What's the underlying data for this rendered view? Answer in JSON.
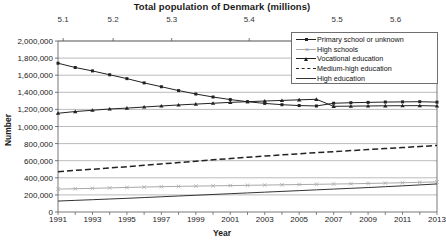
{
  "chart_data": {
    "type": "line",
    "title": "Total population of Denmark (millions)",
    "xlabel": "Year",
    "ylabel": "Number",
    "ylim": [
      0,
      2000000
    ],
    "grid": true,
    "legend_position": "top-right",
    "y_ticks": [
      "0",
      "200,000",
      "400,000",
      "600,000",
      "800,000",
      "1,000,000",
      "1,200,000",
      "1,400,000",
      "1,600,000",
      "1,800,000",
      "2,000,000"
    ],
    "y_tick_values": [
      0,
      200000,
      400000,
      600000,
      800000,
      1000000,
      1200000,
      1400000,
      1600000,
      1800000,
      2000000
    ],
    "x": [
      1991,
      1992,
      1993,
      1994,
      1995,
      1996,
      1997,
      1998,
      1999,
      2000,
      2001,
      2002,
      2003,
      2004,
      2005,
      2006,
      2007,
      2008,
      2009,
      2010,
      2011,
      2012,
      2013
    ],
    "x_tick_labels": [
      "1991",
      "1993",
      "1995",
      "1997",
      "1999",
      "2001",
      "2003",
      "2005",
      "2007",
      "2009",
      "2011",
      "2013"
    ],
    "x_tick_values": [
      1991,
      1993,
      1995,
      1997,
      1999,
      2001,
      2003,
      2005,
      2007,
      2009,
      2011,
      2013
    ],
    "secondary_axis": {
      "label": "Total population of Denmark (millions)",
      "position": "top",
      "tick_labels": [
        "5.1",
        "5.2",
        "5.3",
        "5.4",
        "5.5",
        "5.6"
      ],
      "tick_values": [
        5.1,
        5.2,
        5.3,
        5.4,
        5.5,
        5.6
      ],
      "tick_years": [
        1991.3,
        1994.2,
        1997.6,
        2002.1,
        2007.2,
        2010.6
      ]
    },
    "series": [
      {
        "name": "Primary school or unknown",
        "marker": "square",
        "style": "solid",
        "color": "#222222",
        "values": [
          1740000,
          1690000,
          1650000,
          1605000,
          1560000,
          1510000,
          1465000,
          1420000,
          1380000,
          1345000,
          1315000,
          1290000,
          1270000,
          1255000,
          1245000,
          1240000,
          1272000,
          1278000,
          1282000,
          1286000,
          1288000,
          1290000,
          1285000
        ]
      },
      {
        "name": "High schools",
        "marker": "x",
        "style": "solid",
        "color": "#a8a8a8",
        "values": [
          268000,
          272000,
          277000,
          282000,
          287000,
          292000,
          296000,
          300000,
          303000,
          306000,
          309000,
          312000,
          315000,
          318000,
          321000,
          324000,
          327000,
          330000,
          334000,
          338000,
          342000,
          347000,
          352000
        ]
      },
      {
        "name": "Vocational education",
        "marker": "triangle",
        "style": "solid",
        "color": "#222222",
        "values": [
          1155000,
          1175000,
          1190000,
          1205000,
          1215000,
          1228000,
          1240000,
          1252000,
          1262000,
          1272000,
          1282000,
          1290000,
          1298000,
          1305000,
          1312000,
          1318000,
          1236000,
          1238000,
          1240000,
          1242000,
          1243000,
          1244000,
          1240000
        ]
      },
      {
        "name": "Medium-high education",
        "marker": "none",
        "style": "dashed",
        "color": "#222222",
        "values": [
          472000,
          487000,
          500000,
          515000,
          530000,
          546000,
          562000,
          578000,
          594000,
          610000,
          625000,
          640000,
          654000,
          668000,
          681000,
          694000,
          706000,
          718000,
          730000,
          742000,
          754000,
          766000,
          778000
        ]
      },
      {
        "name": "High education",
        "marker": "none",
        "style": "solid",
        "color": "#333333",
        "values": [
          128000,
          136000,
          144000,
          152000,
          160000,
          169000,
          178000,
          187000,
          196000,
          205000,
          214000,
          223000,
          232000,
          241000,
          250000,
          259000,
          268000,
          277000,
          286000,
          296000,
          306000,
          317000,
          328000
        ]
      }
    ]
  },
  "legend": {
    "items": [
      {
        "label": "Primary school or unknown"
      },
      {
        "label": "High schools"
      },
      {
        "label": "Vocational education"
      },
      {
        "label": "Medium-high education"
      },
      {
        "label": "High education"
      }
    ]
  }
}
